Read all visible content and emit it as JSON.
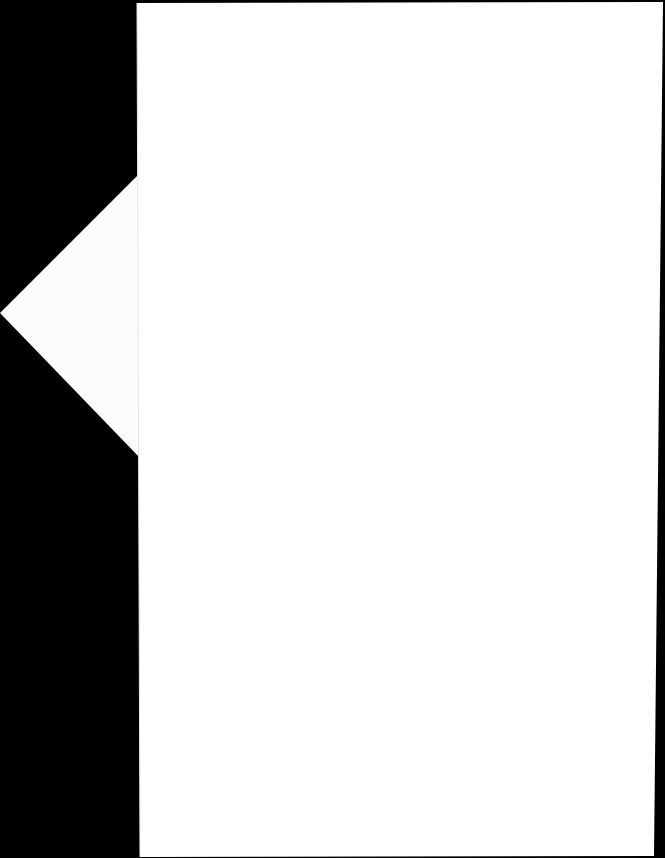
{
  "scene": {
    "description": "Blank white sheet of paper on black background with a white triangular flap on the left edge",
    "background_color": "#000000",
    "page_color": "#ffffff",
    "flap_color": "#fdfdfd",
    "text_content": []
  }
}
